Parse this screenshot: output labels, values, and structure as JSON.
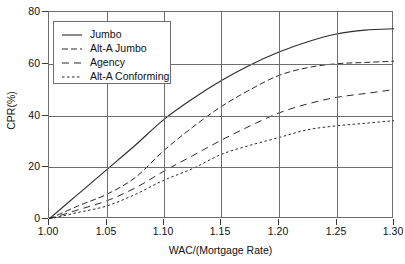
{
  "chart_data": {
    "type": "line",
    "title": "",
    "xlabel": "WAC/(Mortgage Rate)",
    "ylabel": "CPR(%)",
    "xlim": [
      1.0,
      1.3
    ],
    "ylim": [
      0,
      80
    ],
    "grid": true,
    "legend_position": "top-left",
    "xticks": [
      "1.00",
      "1.05",
      "1.10",
      "1.15",
      "1.20",
      "1.25",
      "1.30"
    ],
    "xtick_values": [
      1.0,
      1.05,
      1.1,
      1.15,
      1.2,
      1.25,
      1.3
    ],
    "yticks": [
      "0",
      "20",
      "40",
      "60",
      "80"
    ],
    "ytick_values": [
      0,
      20,
      40,
      60,
      80
    ],
    "x": [
      1.0,
      1.025,
      1.05,
      1.075,
      1.1,
      1.125,
      1.15,
      1.175,
      1.2,
      1.225,
      1.25,
      1.275,
      1.3
    ],
    "series": [
      {
        "name": "Jumbo",
        "style": "solid",
        "values": [
          0,
          9.5,
          19.0,
          28.5,
          38.5,
          46.5,
          53.5,
          59.5,
          64.5,
          68.5,
          71.5,
          73.0,
          73.5
        ]
      },
      {
        "name": "Alt-A Jumbo",
        "style": "dashed",
        "values": [
          0,
          5.0,
          9.5,
          16.0,
          26.5,
          35.5,
          43.5,
          50.0,
          55.5,
          58.5,
          60.0,
          60.5,
          61.0
        ]
      },
      {
        "name": "Agency",
        "style": "dashed-long",
        "values": [
          0,
          3.5,
          7.0,
          12.0,
          18.5,
          24.5,
          30.5,
          36.0,
          41.0,
          44.5,
          47.0,
          48.5,
          50.0
        ]
      },
      {
        "name": "Alt-A Conforming",
        "style": "dotted",
        "values": [
          0,
          2.5,
          5.0,
          9.5,
          15.0,
          19.5,
          25.0,
          28.5,
          31.5,
          34.5,
          36.0,
          37.0,
          38.0
        ]
      }
    ]
  },
  "legend": {
    "entries": [
      {
        "label": "Jumbo",
        "style": "solid"
      },
      {
        "label": "Alt-A Jumbo",
        "style": "dashed"
      },
      {
        "label": "Agency",
        "style": "dashed-long"
      },
      {
        "label": "Alt-A Conforming",
        "style": "dotted"
      }
    ]
  },
  "colors": {
    "curve": "#2b2b2b",
    "axis": "#6e6e6e",
    "text": "#111111",
    "background": "#ffffff"
  }
}
